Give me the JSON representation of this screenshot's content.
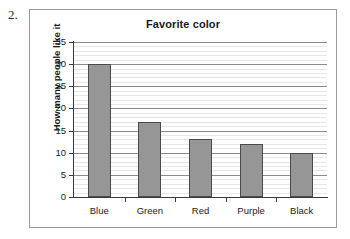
{
  "figure": {
    "number": "2."
  },
  "chart_data": {
    "type": "bar",
    "title": "Favorite color",
    "xlabel": "",
    "ylabel": "How many people like it",
    "categories": [
      "Blue",
      "Green",
      "Red",
      "Purple",
      "Black"
    ],
    "values": [
      30,
      17,
      13,
      12,
      10
    ],
    "ylim": [
      0,
      35
    ],
    "ytick_step": 5,
    "yticks": [
      0,
      5,
      10,
      15,
      20,
      25,
      30,
      35
    ],
    "ytick_labels": [
      "0",
      "5",
      "10",
      "15",
      "20",
      "25",
      "30",
      "35"
    ],
    "minor_gridline_step": 1,
    "grid": true,
    "legend": false,
    "bar_color": "#969696",
    "bar_border_color": "#4a4a4a",
    "major_gridline_color": "#8c8c8c",
    "minor_gridline_color": "#e6e6e6",
    "plot_background": "#ffffff",
    "frame_border_color": "#9a9a9a"
  }
}
